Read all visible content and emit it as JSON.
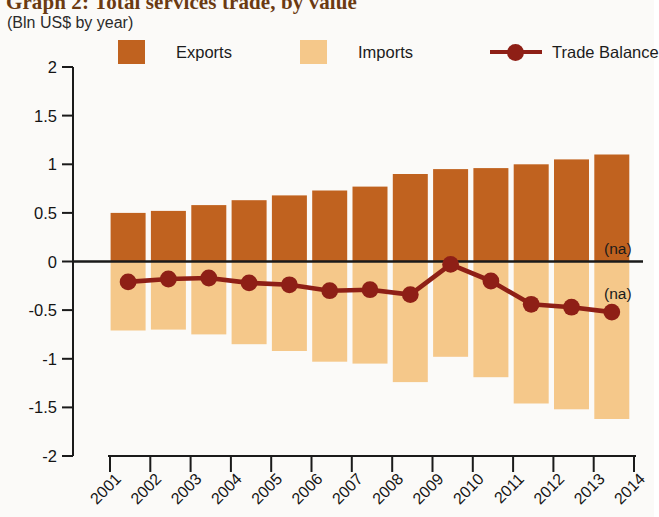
{
  "header": {
    "title": "Graph 2: Total services trade, by value",
    "subtitle": "(Bln US$ by year)"
  },
  "legend": {
    "position": "top",
    "items": [
      {
        "label": "Exports",
        "type": "swatch",
        "color": "#C0621F"
      },
      {
        "label": "Imports",
        "type": "swatch",
        "color": "#F5C88A"
      },
      {
        "label": "Trade Balance",
        "type": "line-marker",
        "color": "#8E1F16"
      }
    ]
  },
  "annotations": [
    {
      "text": "(na)",
      "x": 2014,
      "y": 0.14
    },
    {
      "text": "(na)",
      "x": 2014,
      "y": -0.32
    }
  ],
  "colors": {
    "exports": "#C0621F",
    "imports": "#F5C88A",
    "trade_balance": "#8E1F16",
    "axis": "#1a1a1a",
    "background": "#fbfaf8",
    "title": "#6b3a12"
  },
  "chart_data": {
    "type": "bar",
    "title": "Graph 2: Total services trade, by value",
    "subtitle": "(Bln US$ by year)",
    "xlabel": "",
    "ylabel": "Bln US$ by year",
    "ylim": [
      -2,
      2
    ],
    "yticks": [
      2,
      1.5,
      1,
      0.5,
      0,
      -0.5,
      -1,
      -1.5,
      -2
    ],
    "ytick_labels": [
      "2",
      "1.5",
      "1",
      "0.5",
      "0",
      "-0.5",
      "-1",
      "-1.5",
      "-2"
    ],
    "xticks": [
      2001,
      2002,
      2003,
      2004,
      2005,
      2006,
      2007,
      2008,
      2009,
      2010,
      2011,
      2012,
      2013,
      2014
    ],
    "xtick_labels": [
      "2001",
      "2002",
      "2003",
      "2004",
      "2005",
      "2006",
      "2007",
      "2008",
      "2009",
      "2010",
      "2011",
      "2012",
      "2013",
      "2014"
    ],
    "grid": false,
    "categories": [
      "2001",
      "2002",
      "2003",
      "2004",
      "2005",
      "2006",
      "2007",
      "2008",
      "2009",
      "2010",
      "2011",
      "2012",
      "2013"
    ],
    "series": [
      {
        "name": "Exports",
        "type": "bar",
        "color": "#C0621F",
        "values": [
          0.5,
          0.52,
          0.58,
          0.63,
          0.68,
          0.73,
          0.77,
          0.9,
          0.95,
          0.96,
          1.0,
          1.05,
          1.1
        ]
      },
      {
        "name": "Imports",
        "type": "bar",
        "color": "#F5C88A",
        "values": [
          -0.71,
          -0.7,
          -0.75,
          -0.85,
          -0.92,
          -1.03,
          -1.05,
          -1.24,
          -0.98,
          -1.19,
          -1.46,
          -1.52,
          -1.62
        ]
      },
      {
        "name": "Trade Balance",
        "type": "line",
        "color": "#8E1F16",
        "values": [
          -0.21,
          -0.18,
          -0.17,
          -0.22,
          -0.24,
          -0.3,
          -0.29,
          -0.34,
          -0.03,
          -0.2,
          -0.44,
          -0.47,
          -0.52
        ]
      }
    ]
  }
}
